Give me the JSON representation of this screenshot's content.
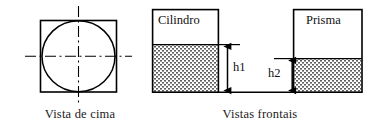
{
  "figure": {
    "title": "",
    "captions": {
      "top_view": "Vista de cima",
      "front_views": "Vistas frontais"
    },
    "labels": {
      "cylinder": "Cilindro",
      "prism": "Prisma",
      "height_1": "h1",
      "height_2": "h2"
    },
    "colors": {
      "stroke": "#000000",
      "fill_hatch": "#6b6b6b",
      "background": "#ffffff",
      "text": "#111111"
    },
    "top_view": {
      "shape_outer": "square",
      "shape_inner": "circle",
      "centerlines": "dash-dot horizontal and vertical"
    },
    "front_views": {
      "cylinder": {
        "label": "Cilindro",
        "fill_pattern": "stippled",
        "water_level_label": "h1"
      },
      "prism": {
        "label": "Prisma",
        "fill_pattern": "stippled",
        "water_level_label": "h2"
      }
    }
  }
}
